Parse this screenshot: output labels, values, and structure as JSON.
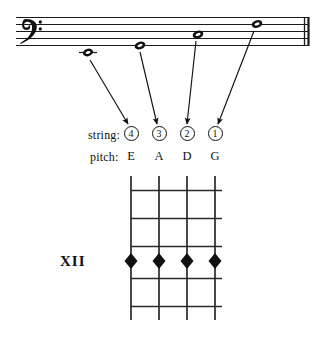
{
  "figure": {
    "type": "music-notation-diagram",
    "ink_color": "#111111",
    "background": "#ffffff"
  },
  "staff": {
    "clef": "bass-clef",
    "clef_glyph": "𝄢",
    "line_count": 5,
    "barline": "double-barline",
    "notes": [
      {
        "pitch": "E",
        "note_head": "whole-note",
        "ledger_line": true,
        "string": "4",
        "x": 88,
        "y": 53
      },
      {
        "pitch": "A",
        "note_head": "whole-note",
        "ledger_line": false,
        "string": "3",
        "x": 140,
        "y": 45
      },
      {
        "pitch": "D",
        "note_head": "whole-note",
        "ledger_line": false,
        "string": "2",
        "x": 198,
        "y": 34
      },
      {
        "pitch": "G",
        "note_head": "whole-note",
        "ledger_line": false,
        "string": "1",
        "x": 257,
        "y": 23
      }
    ]
  },
  "labels": {
    "string_row_label": "string:",
    "pitch_row_label": "pitch:",
    "position_marker": "XII"
  },
  "strings": [
    {
      "number": "4",
      "pitch": "E",
      "x": 131
    },
    {
      "number": "3",
      "pitch": "A",
      "x": 159
    },
    {
      "number": "2",
      "pitch": "D",
      "x": 187
    },
    {
      "number": "1",
      "pitch": "G",
      "x": 215
    }
  ],
  "fretboard": {
    "string_count": 4,
    "fret_line_count": 5,
    "marker_shape": "diamond",
    "marker_count": 4,
    "marker_fret_row": 4
  }
}
